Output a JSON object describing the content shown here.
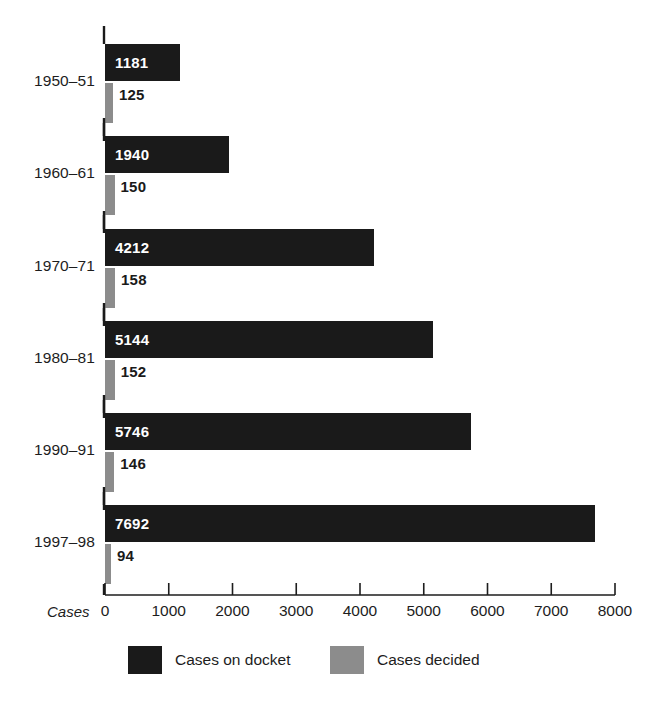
{
  "chart_data": {
    "type": "bar",
    "orientation": "horizontal",
    "title": "",
    "xlabel": "Cases",
    "ylabel": "",
    "xlim": [
      0,
      8000
    ],
    "xticks": [
      0,
      1000,
      2000,
      3000,
      4000,
      5000,
      6000,
      7000,
      8000
    ],
    "xtick_labels": [
      "0",
      "1000",
      "2000",
      "3000",
      "4000",
      "5000",
      "6000",
      "7000",
      "8000"
    ],
    "grid": false,
    "legend_position": "bottom",
    "categories": [
      "1950–51",
      "1960–61",
      "1970–71",
      "1980–81",
      "1990–91",
      "1997–98"
    ],
    "series": [
      {
        "name": "Cases on docket",
        "color": "#1a1a1a",
        "values": [
          1181,
          1940,
          4212,
          5144,
          5746,
          7692
        ],
        "value_labels": [
          "1181",
          "1940",
          "4212",
          "5144",
          "5746",
          "7692"
        ]
      },
      {
        "name": "Cases decided",
        "color": "#8c8c8c",
        "values": [
          125,
          150,
          158,
          152,
          146,
          94
        ],
        "value_labels": [
          "125",
          "150",
          "158",
          "152",
          "146",
          "94"
        ]
      }
    ]
  },
  "axis": {
    "x_title": "Cases"
  },
  "legend": {
    "items": [
      {
        "label": "Cases on docket",
        "swatch": "docket"
      },
      {
        "label": "Cases decided",
        "swatch": "decided"
      }
    ]
  }
}
